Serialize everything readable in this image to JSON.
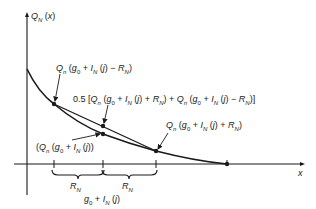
{
  "diagram": {
    "y_axis_label": "Q_N (x)",
    "x_axis_label": "x",
    "labels": {
      "upper_point": "Q_n (g_0 + I_N (j) − R_N)",
      "chord_mid": "0.5 [Q_n (g_0 + I_N (j) + R_N) + Q_n (g_0 + I_N (j) − R_N)]",
      "curve_mid": "(Q_n (g_0 + I_N (j))",
      "lower_point": "Q_n (g_0 + I_N (j) + R_N)",
      "brace_left": "R_N",
      "brace_right": "R_N",
      "center_x": "g_0 + I_N (j)"
    },
    "colors": {
      "stroke": "#1a1a1a",
      "text": "#222222"
    }
  }
}
